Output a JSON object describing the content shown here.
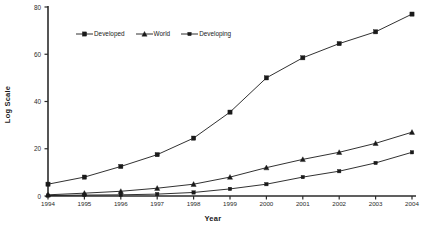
{
  "chart_data": {
    "type": "line",
    "title": "",
    "xlabel": "Year",
    "ylabel": "Log Scale",
    "categories": [
      "1994",
      "1995",
      "1996",
      "1997",
      "1998",
      "1999",
      "2000",
      "2001",
      "2002",
      "2003",
      "2004"
    ],
    "x": [
      1994,
      1995,
      1996,
      1997,
      1998,
      1999,
      2000,
      2001,
      2002,
      2003,
      2004
    ],
    "xlim": [
      1994,
      2004
    ],
    "ylim": [
      0,
      80
    ],
    "yticks": [
      0,
      20,
      40,
      60,
      80
    ],
    "xticks": [
      "1994",
      "1995",
      "1996",
      "1997",
      "1998",
      "1999",
      "2000",
      "2001",
      "2002",
      "2003",
      "2004"
    ],
    "grid": false,
    "legend_position": "top-left-inside",
    "series": [
      {
        "name": "Developed",
        "marker": "square",
        "color": "#1a1a1a",
        "values": [
          5,
          8,
          12.5,
          17.5,
          24.5,
          35.5,
          50,
          58.5,
          64.5,
          69.5,
          77
        ]
      },
      {
        "name": "World",
        "marker": "triangle",
        "color": "#1a1a1a",
        "values": [
          0.5,
          1.2,
          2,
          3.3,
          5,
          8,
          12,
          15.5,
          18.5,
          22.3,
          27
        ]
      },
      {
        "name": "Developing",
        "marker": "square-small",
        "color": "#1a1a1a",
        "values": [
          0.2,
          0.4,
          0.5,
          0.8,
          1.5,
          3,
          5,
          8,
          10.5,
          14,
          18.5
        ]
      }
    ]
  },
  "axis": {
    "y_title": "Log Scale",
    "x_title": "Year"
  },
  "legend": {
    "items": [
      {
        "label": "Developed"
      },
      {
        "label": "World"
      },
      {
        "label": "Developing"
      }
    ]
  },
  "colors": {
    "line": "#1a1a1a",
    "axis": "#2b2b2b",
    "background": "#ffffff",
    "text": "#1a1a1a"
  }
}
